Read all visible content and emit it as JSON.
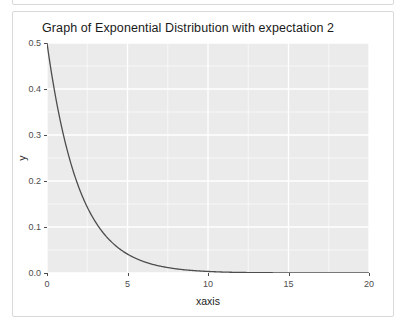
{
  "card": {
    "border_color": "#d9d9d9",
    "background": "#ffffff"
  },
  "chart_data": {
    "type": "line",
    "title": "Graph of Exponential Distribution with expectation 2",
    "xlabel": "xaxis",
    "ylabel": "y",
    "xlim": [
      0,
      20
    ],
    "ylim": [
      0.0,
      0.5
    ],
    "grid": true,
    "legend": "none",
    "panel_background": "#ebebeb",
    "gridline_color": "#ffffff",
    "line_color": "#4d4d4d",
    "x_ticks": [
      "0",
      "5",
      "10",
      "15",
      "20"
    ],
    "x_tick_values": [
      0,
      5,
      10,
      15,
      20
    ],
    "x_minor_ticks": [
      2.5,
      7.5,
      12.5,
      17.5
    ],
    "y_ticks": [
      "0.0",
      "0.1",
      "0.2",
      "0.3",
      "0.4",
      "0.5"
    ],
    "y_tick_values": [
      0.0,
      0.1,
      0.2,
      0.3,
      0.4,
      0.5
    ],
    "y_minor_ticks": [
      0.05,
      0.15,
      0.25,
      0.35,
      0.45
    ],
    "formula": "y = 0.5 * exp(-x / 2)",
    "rate": 0.5,
    "expectation": 2,
    "series": [
      {
        "name": "exponential-pdf",
        "x": [
          0,
          0.5,
          1,
          1.5,
          2,
          2.5,
          3,
          3.5,
          4,
          4.5,
          5,
          5.5,
          6,
          6.5,
          7,
          7.5,
          8,
          8.5,
          9,
          9.5,
          10,
          11,
          12,
          13,
          14,
          15,
          16,
          17,
          18,
          19,
          20
        ],
        "values": [
          0.5,
          0.3894,
          0.3033,
          0.2362,
          0.1839,
          0.1433,
          0.1116,
          0.0869,
          0.0677,
          0.0527,
          0.041,
          0.032,
          0.0249,
          0.0194,
          0.0151,
          0.0118,
          0.0092,
          0.0071,
          0.0056,
          0.0043,
          0.0034,
          0.002,
          0.0012,
          0.0008,
          0.0005,
          0.0003,
          0.0002,
          0.0001,
          0.0001,
          0.0,
          0.0
        ]
      }
    ]
  }
}
